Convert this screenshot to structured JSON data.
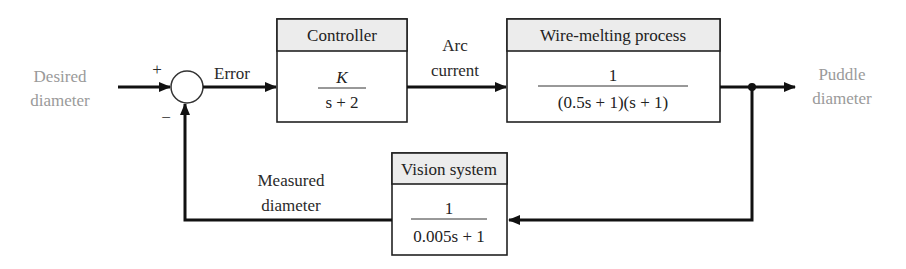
{
  "diagram": {
    "type": "feedback-control-block-diagram",
    "input": {
      "label_line1": "Desired",
      "label_line2": "diameter",
      "color": "#9a9a9a"
    },
    "summing_junction": {
      "plus_sign": "+",
      "minus_sign": "−"
    },
    "error_label": "Error",
    "controller": {
      "title": "Controller",
      "numerator": "K",
      "denominator": "s + 2"
    },
    "arc_label": {
      "line1": "Arc",
      "line2": "current"
    },
    "process": {
      "title": "Wire-melting process",
      "numerator": "1",
      "denominator": "(0.5s + 1)(s + 1)"
    },
    "output": {
      "label_line1": "Puddle",
      "label_line2": "diameter",
      "color": "#9a9a9a"
    },
    "sensor": {
      "title": "Vision system",
      "numerator": "1",
      "denominator": "0.005s + 1"
    },
    "feedback_label": {
      "line1": "Measured",
      "line2": "diameter"
    }
  }
}
